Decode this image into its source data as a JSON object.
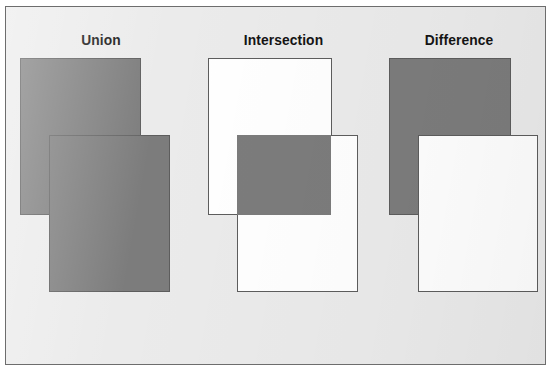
{
  "figure": {
    "kind": "boolean-set-operations-diagram",
    "background_color": "#ffffff",
    "plate_color": "#ebebeb",
    "plate_border_color": "#6d6d6d",
    "fill_color": "#7c7c7c",
    "outline_color": "#5d5d5d",
    "hollow_color": "#ffffff"
  },
  "panels": [
    {
      "id": "union",
      "title": "Union",
      "description": "Both rectangles fully shaded; the combined area of A and B.",
      "shapes": [
        {
          "name": "rect-a",
          "style": "filled",
          "x": 14,
          "y": 51,
          "w": 121,
          "h": 157
        },
        {
          "name": "rect-b",
          "style": "filled",
          "x": 43,
          "y": 128,
          "w": 121,
          "h": 157
        }
      ]
    },
    {
      "id": "intersection",
      "title": "Intersection",
      "description": "Only the region common to both rectangles is shaded.",
      "shapes": [
        {
          "name": "rect-a",
          "style": "hollow",
          "x": 12,
          "y": 51,
          "w": 124,
          "h": 157
        },
        {
          "name": "rect-b",
          "style": "hollow",
          "x": 41,
          "y": 128,
          "w": 121,
          "h": 157
        },
        {
          "name": "overlap-region",
          "style": "overlap",
          "x": 41,
          "y": 128,
          "w": 94,
          "h": 80
        }
      ]
    },
    {
      "id": "difference",
      "title": "Difference",
      "description": "Rectangle B is subtracted from rectangle A, leaving an L shape.",
      "shapes": [
        {
          "name": "rect-a",
          "style": "filled",
          "x": 18,
          "y": 51,
          "w": 122,
          "h": 157
        },
        {
          "name": "rect-b",
          "style": "knockout",
          "x": 47,
          "y": 128,
          "w": 120,
          "h": 157
        }
      ]
    }
  ]
}
